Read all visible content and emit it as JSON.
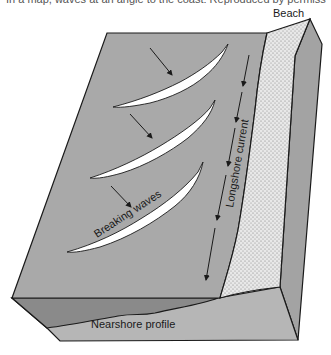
{
  "caption": "In a map, waves at an angle to the coast: Reproduced by permission.",
  "diagram": {
    "type": "block-diagram",
    "labels": {
      "beach": "Beach",
      "longshore_current": "Longshore current",
      "breaking_waves": "Breaking waves",
      "nearshore_profile": "Nearshore profile"
    },
    "colors": {
      "water_surface": "#a9a9a9",
      "front_face": "#b6b6b6",
      "water_section": "#8a8a8a",
      "right_face": "#a3a3a3",
      "beach_sand": "#e6e6e6",
      "outline": "#1a1a1a",
      "wave_foam": "#ffffff"
    },
    "elements": [
      {
        "id": "wave-1",
        "kind": "breaking-wave",
        "approach_arrow": true
      },
      {
        "id": "wave-2",
        "kind": "breaking-wave",
        "approach_arrow": true
      },
      {
        "id": "wave-3",
        "kind": "breaking-wave",
        "approach_arrow": true,
        "label": "Breaking waves"
      },
      {
        "id": "current",
        "kind": "arrow-chain",
        "direction": "down-coast",
        "label": "Longshore current"
      },
      {
        "id": "beach",
        "kind": "stippled-zone",
        "label": "Beach"
      },
      {
        "id": "profile",
        "kind": "cross-section",
        "label": "Nearshore profile"
      }
    ]
  }
}
